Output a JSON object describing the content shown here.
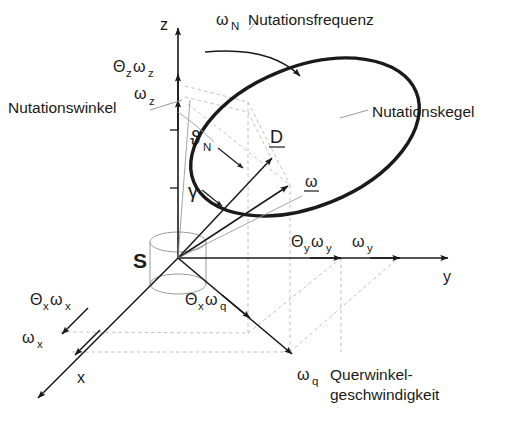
{
  "figure": {
    "background_color": "#ffffff",
    "stroke_color": "#1a1a1a",
    "guide_color": "#b9b9b9",
    "cylinder_color": "#9a9a9a"
  },
  "axes": [
    {
      "id": "z",
      "label": "z",
      "direction": "up"
    },
    {
      "id": "y",
      "label": "y",
      "direction": "right"
    },
    {
      "id": "x",
      "label": "x",
      "direction": "down-left"
    }
  ],
  "origin": {
    "label": "S",
    "name": "schwerpunkt"
  },
  "axis_components": {
    "z_upper": {
      "base": "Θ",
      "base_sub": "z",
      "omega": "ω",
      "omega_sub": "z"
    },
    "z_lower": {
      "omega": "ω",
      "omega_sub": "z"
    },
    "y_inner": {
      "base": "Θ",
      "base_sub": "y",
      "omega": "ω",
      "omega_sub": "y"
    },
    "y_outer": {
      "omega": "ω",
      "omega_sub": "y"
    },
    "x_inner": {
      "base": "Θ",
      "base_sub": "x",
      "omega": "ω",
      "omega_sub": "x"
    },
    "x_outer": {
      "omega": "ω",
      "omega_sub": "x"
    },
    "q_inner": {
      "base": "Θ",
      "base_sub": "x",
      "omega": "ω",
      "omega_sub": "q"
    },
    "q_outer": {
      "omega": "ω",
      "omega_sub": "q"
    }
  },
  "vectors": [
    {
      "id": "drall",
      "label": "D",
      "underlined": true
    },
    {
      "id": "omega",
      "label": "ω",
      "underlined": true
    }
  ],
  "angles": [
    {
      "id": "nutationswinkel",
      "symbol": "ϑ",
      "subscript": "N"
    },
    {
      "id": "gamma",
      "symbol": "γ",
      "subscript": ""
    }
  ],
  "annotations": {
    "nutationsfrequenz": {
      "symbol": "ω",
      "subscript": "N",
      "text": "Nutationsfrequenz"
    },
    "nutationswinkel": {
      "text": "Nutationswinkel"
    },
    "nutationskegel": {
      "text": "Nutationskegel"
    },
    "querwinkelgeschwindigkeit": {
      "symbol": "ω",
      "subscript": "q",
      "line1": "Querwinkel-",
      "line2": "geschwindigkeit"
    }
  }
}
